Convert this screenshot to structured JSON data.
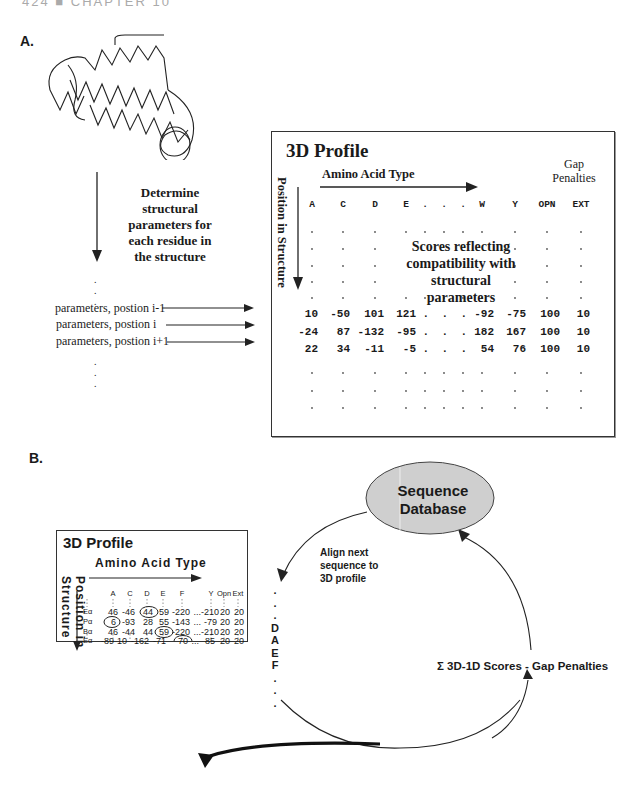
{
  "running_head": "424 ■ CHAPTER 10",
  "panel_a": {
    "label": "A.",
    "step_text": [
      "Determine",
      "structural",
      "parameters for",
      "each residue in",
      "the structure"
    ],
    "param_rows": [
      "parameters, postion i-1",
      "parameters, postion i",
      "parameters, postion i+1"
    ],
    "profile": {
      "title": "3D  Profile",
      "aa_label": "Amino Acid Type",
      "gap_label": [
        "Gap",
        "Penalties"
      ],
      "position_label": "Position in Structure",
      "columns": [
        "A",
        "C",
        "D",
        "E",
        ".",
        ".",
        ".",
        "W",
        "Y",
        "OPN",
        "EXT"
      ],
      "score_text": [
        "Scores reflecting",
        "compatibility with",
        "structural",
        "parameters"
      ],
      "rows": [
        [
          "10",
          "-50",
          "101",
          "121",
          ".",
          ".",
          ".",
          "-92",
          "-75",
          "100",
          "10"
        ],
        [
          "-24",
          "87",
          "-132",
          "-95",
          ".",
          ".",
          ".",
          "182",
          "167",
          "100",
          "10"
        ],
        [
          "22",
          "34",
          "-11",
          "-5",
          ".",
          ".",
          ".",
          "54",
          "76",
          "100",
          "10"
        ]
      ]
    }
  },
  "panel_b": {
    "label": "B.",
    "profile": {
      "title": "3D Profile",
      "aa_label": "Amino  Acid  Type",
      "position_label": "Position  in  Structure",
      "columns": [
        "A",
        "C",
        "D",
        "E",
        "F",
        "",
        "Y",
        "Opn",
        "Ext"
      ],
      "rows": [
        {
          "label": "Eα",
          "values": [
            "46",
            "-46",
            "44",
            "59",
            "-220",
            "...",
            "-210",
            "20",
            "20"
          ],
          "circled": [
            2
          ]
        },
        {
          "label": "Pα",
          "values": [
            "6",
            "-93",
            "28",
            "55",
            "-143",
            "...",
            "-79",
            "20",
            "20"
          ],
          "circled": [
            0
          ]
        },
        {
          "label": "Bα",
          "values": [
            "46",
            "-44",
            "44",
            "59",
            "-220",
            "...",
            "-210",
            "20",
            "20"
          ],
          "circled": [
            3
          ]
        },
        {
          "label": "Eα",
          "values": [
            "-89",
            "10",
            "-162",
            "-71",
            "70",
            "...",
            "85",
            "20",
            "20"
          ],
          "circled": [
            4
          ]
        }
      ]
    },
    "database": [
      "Sequence",
      "Database"
    ],
    "align_text": [
      "Align next",
      "sequence to",
      "3D profile"
    ],
    "sequence": [
      ".",
      ".",
      ".",
      "D",
      "A",
      "E",
      "F",
      ".",
      ".",
      "."
    ],
    "sum_text": "Σ  3D-1D  Scores  -  Gap  Penalties"
  },
  "colors": {
    "ink": "#1a1a1a",
    "ellipse_fill": "#cfcfcf",
    "border": "#333333"
  }
}
